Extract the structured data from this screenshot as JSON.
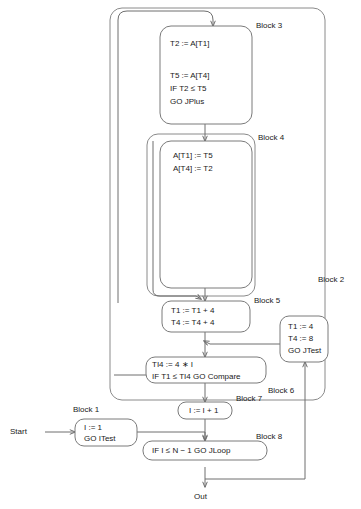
{
  "diagram": {
    "terminals": {
      "start": "Start",
      "out": "Out"
    },
    "labels": {
      "block1": "Block 1",
      "block2": "Block 2",
      "block3": "Block 3",
      "block4": "Block 4",
      "block5": "Block 5",
      "block6": "Block 6",
      "block7": "Block 7",
      "block8": "Block 8"
    },
    "nodes": {
      "block3": {
        "lines": [
          "T2 := A[T1]",
          "",
          "T5 := A[T4]",
          "IF T2 ≤ T5",
          "GO JPlus"
        ]
      },
      "block4": {
        "lines": [
          "A[T1] := T5",
          "A[T4] := T2"
        ]
      },
      "block5": {
        "lines": [
          "T1 := T1 + 4",
          "T4 := T4 + 4"
        ]
      },
      "block6": {
        "lines": [
          "TI4 := 4 ∗ I",
          "IF T1 ≤ TI4 GO Compare"
        ]
      },
      "block7": {
        "lines": [
          "I := I + 1"
        ]
      },
      "block8": {
        "lines": [
          "IF I ≤ N − 1 GO JLoop"
        ]
      },
      "block1": {
        "lines": [
          "I := 1",
          "GO ITest"
        ]
      },
      "jtest": {
        "lines": [
          "T1 := 4",
          "T4 := 8",
          "GO JTest"
        ]
      }
    },
    "colors": {
      "stroke": "#7a7a7a",
      "edge": "#6e6e6e",
      "text": "#1a1a1a",
      "background": "#ffffff"
    }
  }
}
